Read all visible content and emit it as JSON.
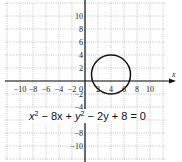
{
  "chart_data": {
    "type": "line",
    "title": "",
    "equation": "x² − 8x + y² − 2y + 8 = 0",
    "equation_parts": {
      "a": "x",
      "b": " − 8x + ",
      "c": "y",
      "d": " − 2y + 8 = 0",
      "sup": "2"
    },
    "xlabel": "x",
    "ylabel": "",
    "xlim": [
      -12,
      12
    ],
    "ylim": [
      -12,
      12
    ],
    "grid": true,
    "grid_step": 2,
    "x_ticks": [
      "-10",
      "-8",
      "-6",
      "-4",
      "-2",
      "0",
      "2",
      "4",
      "6",
      "8",
      "10"
    ],
    "y_ticks": [
      "10",
      "8",
      "6",
      "4",
      "2",
      "-2",
      "-4",
      "-8",
      "-10"
    ],
    "series": [
      {
        "name": "circle",
        "shape": "circle",
        "center": [
          4,
          1
        ],
        "radius": 3
      }
    ]
  }
}
